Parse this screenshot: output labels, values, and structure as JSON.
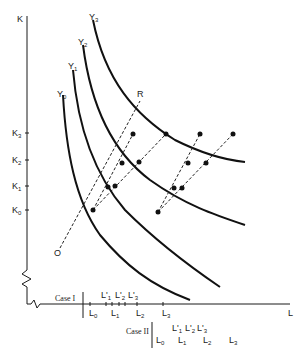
{
  "diagram": {
    "axes": {
      "y_label": "K",
      "x_label": "L",
      "k_ticks": [
        {
          "label": "K",
          "sub": "3",
          "y": 133
        },
        {
          "label": "K",
          "sub": "2",
          "y": 160
        },
        {
          "label": "K",
          "sub": "1",
          "y": 186
        },
        {
          "label": "K",
          "sub": "0",
          "y": 210
        }
      ]
    },
    "isoquants": [
      {
        "label": "Y",
        "sub": "0"
      },
      {
        "label": "Y",
        "sub": "1"
      },
      {
        "label": "Y",
        "sub": "2"
      },
      {
        "label": "Y",
        "sub": "3"
      }
    ],
    "ray": {
      "origin_label": "O",
      "end_label": "R"
    },
    "case1": {
      "label": "Case I",
      "upper": [
        {
          "label": "L'",
          "sub": "1"
        },
        {
          "label": "L'",
          "sub": "2"
        },
        {
          "label": "L'",
          "sub": "3"
        }
      ],
      "lower": [
        {
          "label": "L",
          "sub": "0"
        },
        {
          "label": "L",
          "sub": "1"
        },
        {
          "label": "L",
          "sub": "2"
        },
        {
          "label": "L",
          "sub": "3"
        }
      ]
    },
    "case2": {
      "label": "Case II",
      "upper": [
        {
          "label": "L'",
          "sub": "1"
        },
        {
          "label": "L'",
          "sub": "2"
        },
        {
          "label": "L'",
          "sub": "3"
        }
      ],
      "lower": [
        {
          "label": "L",
          "sub": "0"
        },
        {
          "label": "L",
          "sub": "1"
        },
        {
          "label": "L",
          "sub": "2"
        },
        {
          "label": "L",
          "sub": "3"
        }
      ]
    }
  }
}
